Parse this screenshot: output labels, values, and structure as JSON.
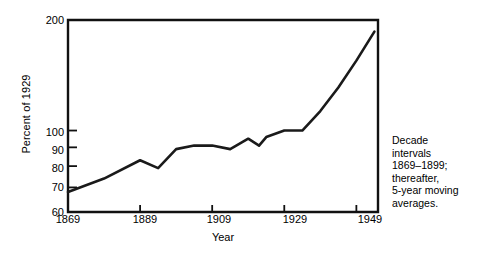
{
  "chart_data": {
    "type": "line",
    "title": "",
    "xlabel": "Year",
    "ylabel": "Percent of 1929",
    "yscale": "log",
    "ylim": [
      60,
      200
    ],
    "xlim": [
      1869,
      1955
    ],
    "grid": false,
    "legend": null,
    "yticks": [
      60,
      70,
      80,
      90,
      100,
      200
    ],
    "ytick_labels": [
      "60",
      "70",
      "80",
      "90",
      "100",
      "200"
    ],
    "xticks": [
      1869,
      1889,
      1909,
      1929,
      1949
    ],
    "xtick_labels": [
      "1869",
      "1889",
      "1909",
      "1929",
      "1949"
    ],
    "annotation": "Decade\nintervals\n1869–1899;\nthereafter,\n5-year moving\naverages.",
    "series": [
      {
        "name": "Percent of 1929",
        "color": "#1a1a1a",
        "x": [
          1869,
          1879,
          1889,
          1894,
          1899,
          1904,
          1909,
          1914,
          1919,
          1922,
          1924,
          1929,
          1934,
          1939,
          1944,
          1949,
          1954
        ],
        "values": [
          68,
          74,
          83,
          79,
          89,
          91,
          91,
          89,
          95,
          91,
          96,
          100,
          100,
          113,
          131,
          155,
          186
        ]
      }
    ]
  }
}
